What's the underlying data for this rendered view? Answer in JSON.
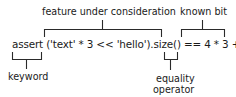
{
  "diagram": {
    "code_line": "assert ('text' * 3 << 'hello').size() == 4 * 3 + 5",
    "annotations": {
      "feature": "feature under consideration",
      "known": "known bit",
      "keyword": "keyword",
      "equality_line1": "equality",
      "equality_line2": "operator"
    }
  }
}
